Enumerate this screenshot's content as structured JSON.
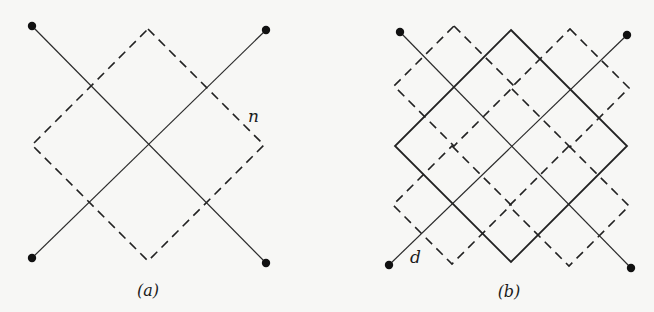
{
  "figure": {
    "panels": [
      {
        "id": "a",
        "caption": "(a)",
        "caption_pos": [
          148,
          296
        ],
        "lines": [
          {
            "from": [
              32,
              26
            ],
            "to": [
              266,
              263
            ],
            "style": "thin"
          },
          {
            "from": [
              32,
              258
            ],
            "to": [
              266,
              30
            ],
            "style": "thin"
          }
        ],
        "dots": [
          [
            32,
            26
          ],
          [
            266,
            30
          ],
          [
            32,
            258
          ],
          [
            266,
            263
          ]
        ],
        "squares": [
          {
            "center": [
              148,
              145
            ],
            "half_diag": 116,
            "style": "dashed"
          }
        ],
        "annotations": [
          {
            "text": "n",
            "pos": [
              248,
              122
            ]
          }
        ]
      },
      {
        "id": "b",
        "caption": "(b)",
        "caption_pos": [
          509,
          297
        ],
        "lines": [
          {
            "from": [
              400,
              32
            ],
            "to": [
              631,
              268
            ],
            "style": "thin"
          },
          {
            "from": [
              389,
              265
            ],
            "to": [
              627,
              35
            ],
            "style": "thin"
          }
        ],
        "dots": [
          [
            400,
            32
          ],
          [
            627,
            35
          ],
          [
            389,
            265
          ],
          [
            631,
            268
          ]
        ],
        "squares": [
          {
            "center": [
              511,
              146
            ],
            "half_diag": 116,
            "style": "solid"
          },
          {
            "center": [
              454,
              86
            ],
            "half_diag": 60,
            "style": "dashed"
          },
          {
            "center": [
              570,
              88
            ],
            "half_diag": 59,
            "style": "dashed"
          },
          {
            "center": [
              452,
              205
            ],
            "half_diag": 59,
            "style": "dashed"
          },
          {
            "center": [
              569,
              206
            ],
            "half_diag": 60,
            "style": "dashed"
          }
        ],
        "annotations": [
          {
            "text": "d",
            "pos": [
              410,
              263
            ]
          }
        ]
      }
    ],
    "labels": {
      "a_caption": "(a)",
      "b_caption": "(b)",
      "n_label": "n",
      "d_label": "d"
    }
  }
}
